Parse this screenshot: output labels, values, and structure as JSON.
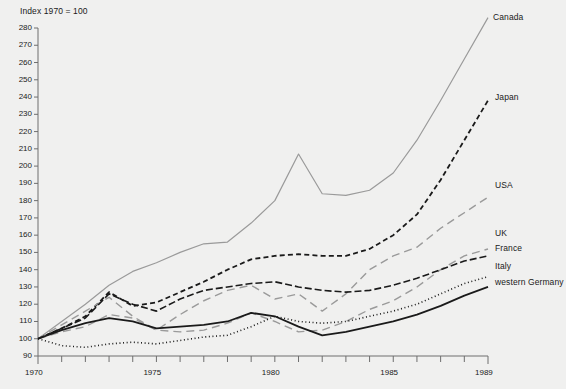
{
  "header": {
    "axis_note": "Index 1970 = 100"
  },
  "chart_data": {
    "type": "line",
    "title": "",
    "subtitle": "",
    "xlabel": "",
    "ylabel": "Index 1970 = 100",
    "grid": false,
    "legend_position": "right-inline",
    "xlim": [
      1970,
      1989
    ],
    "ylim": [
      90,
      280
    ],
    "y_ticks": [
      90,
      100,
      110,
      120,
      130,
      140,
      150,
      160,
      170,
      180,
      190,
      200,
      210,
      220,
      230,
      240,
      250,
      260,
      270,
      280
    ],
    "x_ticks": [
      1970,
      1971,
      1972,
      1973,
      1974,
      1975,
      1976,
      1977,
      1978,
      1979,
      1980,
      1981,
      1982,
      1983,
      1984,
      1985,
      1986,
      1987,
      1988,
      1989
    ],
    "x_tick_labels": [
      "1970",
      "",
      "",
      "",
      "",
      "1975",
      "",
      "",
      "",
      "",
      "1980",
      "",
      "",
      "",
      "",
      "1985",
      "",
      "",
      "",
      "1989"
    ],
    "x": [
      1970,
      1971,
      1972,
      1973,
      1974,
      1975,
      1976,
      1977,
      1978,
      1979,
      1980,
      1981,
      1982,
      1983,
      1984,
      1985,
      1986,
      1987,
      1988,
      1989
    ],
    "series": [
      {
        "name": "Canada",
        "color": "#9a9a9a",
        "style": "solid",
        "width": 1.2,
        "label_x": 493,
        "label_y": 12,
        "values": [
          100,
          110,
          120,
          131,
          139,
          144,
          150,
          155,
          156,
          167,
          180,
          207,
          184,
          183,
          186,
          196,
          215,
          238,
          262,
          286
        ]
      },
      {
        "name": "Japan",
        "color": "#1a1a1a",
        "style": "dash",
        "width": 1.8,
        "label_x": 495,
        "label_y": 92,
        "values": [
          100,
          106,
          113,
          127,
          119,
          121,
          127,
          133,
          140,
          146,
          148,
          149,
          148,
          148,
          152,
          160,
          172,
          192,
          215,
          238
        ]
      },
      {
        "name": "USA",
        "color": "#9a9a9a",
        "style": "longdash",
        "width": 1.4,
        "label_x": 495,
        "label_y": 180,
        "values": [
          100,
          108,
          116,
          124,
          113,
          105,
          114,
          122,
          128,
          131,
          123,
          126,
          116,
          126,
          140,
          148,
          153,
          164,
          173,
          182
        ]
      },
      {
        "name": "UK",
        "color": "#9a9a9a",
        "style": "longdash",
        "width": 1.4,
        "label_x": 495,
        "label_y": 228,
        "values": [
          100,
          104,
          107,
          114,
          112,
          105,
          104,
          105,
          109,
          115,
          110,
          104,
          105,
          110,
          117,
          122,
          130,
          140,
          148,
          152
        ]
      },
      {
        "name": "France",
        "color": "#1a1a1a",
        "style": "dashdot",
        "width": 1.6,
        "label_x": 495,
        "label_y": 243,
        "values": [
          100,
          106,
          112,
          126,
          120,
          116,
          123,
          128,
          130,
          132,
          133,
          130,
          128,
          127,
          128,
          131,
          135,
          140,
          145,
          148
        ]
      },
      {
        "name": "Italy",
        "color": "#1a1a1a",
        "style": "dot",
        "width": 1.6,
        "label_x": 495,
        "label_y": 261,
        "values": [
          100,
          96,
          95,
          97,
          98,
          97,
          99,
          101,
          102,
          107,
          113,
          110,
          109,
          110,
          113,
          116,
          120,
          126,
          132,
          136
        ]
      },
      {
        "name": "western Germany",
        "color": "#1a1a1a",
        "style": "solid",
        "width": 1.8,
        "label_x": 495,
        "label_y": 277,
        "values": [
          100,
          105,
          109,
          112,
          110,
          106,
          107,
          108,
          110,
          115,
          113,
          107,
          102,
          104,
          107,
          110,
          114,
          119,
          125,
          130
        ]
      }
    ]
  },
  "plot_geometry": {
    "left": 38,
    "right": 488,
    "top": 28,
    "bottom": 356,
    "y_min": 90,
    "y_max": 280,
    "x_min": 1970,
    "x_max": 1989,
    "axis_color": "#6e6e6e"
  }
}
